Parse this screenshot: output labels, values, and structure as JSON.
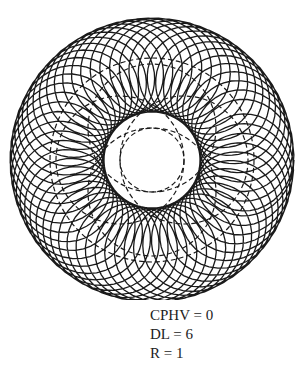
{
  "diagram": {
    "type": "rosette-trajectory",
    "center": [
      152,
      160
    ],
    "line_color": "#1a1a1a",
    "curve": {
      "petals": 17,
      "outer_radius": 142,
      "inner_radius": 48,
      "turns": 1
    },
    "dashed_circles": [
      {
        "cx": 152,
        "cy": 160,
        "r": 102
      },
      {
        "cx": 152,
        "cy": 160,
        "r": 32
      },
      {
        "cx": 152,
        "cy": 128,
        "r": 64
      },
      {
        "cx": 152,
        "cy": 192,
        "r": 64
      },
      {
        "cx": 120,
        "cy": 160,
        "r": 64
      },
      {
        "cx": 184,
        "cy": 160,
        "r": 64
      }
    ]
  },
  "parameters": {
    "cphv": "CPHV = 0",
    "dl": "DL = 6",
    "r": "R = 1"
  }
}
